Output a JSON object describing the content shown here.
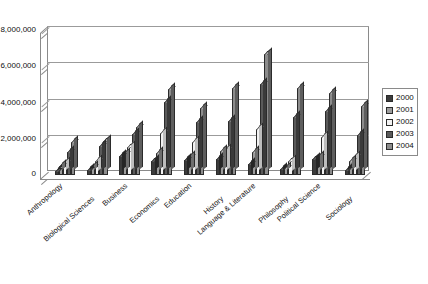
{
  "chart_data": {
    "type": "bar",
    "title": "",
    "subtitle": "",
    "xlabel": "",
    "ylabel": "",
    "ylim": [
      0,
      8000000
    ],
    "yticks": [
      0,
      2000000,
      4000000,
      6000000,
      8000000
    ],
    "ytick_labels": [
      "0",
      "2,000,000",
      "4,000,000",
      "6,000,000",
      "8,000,000"
    ],
    "grid": true,
    "legend_position": "right",
    "style": "3d-clustered-column",
    "categories": [
      "Anthropology",
      "Biological Sciences",
      "Business",
      "Economics",
      "Education",
      "History",
      "Language & Literature",
      "Philosophy",
      "Political Science",
      "Sociology"
    ],
    "series": [
      {
        "name": "2000",
        "color": "#3b3b3b",
        "values": [
          200000,
          250000,
          1050000,
          750000,
          850000,
          900000,
          600000,
          350000,
          900000,
          250000
        ]
      },
      {
        "name": "2001",
        "color": "#9d9d9d",
        "values": [
          500000,
          450000,
          1150000,
          1200000,
          1000000,
          1300000,
          1250000,
          400000,
          1000000,
          750000
        ]
      },
      {
        "name": "2002",
        "color": "#f2f2f2",
        "values": [
          650000,
          800000,
          1550000,
          2300000,
          1800000,
          1400000,
          2550000,
          800000,
          2100000,
          1000000
        ]
      },
      {
        "name": "2003",
        "color": "#5a5a5a",
        "values": [
          1250000,
          1600000,
          2250000,
          4050000,
          2950000,
          3000000,
          5000000,
          3200000,
          3550000,
          2200000
        ]
      },
      {
        "name": "2004",
        "color": "#8c8c8c",
        "values": [
          1800000,
          1850000,
          2650000,
          4750000,
          3700000,
          4800000,
          6650000,
          4800000,
          4550000,
          3800000
        ]
      }
    ]
  },
  "legend": {
    "items": [
      {
        "label": "2000",
        "swatch_class": "s0"
      },
      {
        "label": "2001",
        "swatch_class": "s1"
      },
      {
        "label": "2002",
        "swatch_class": "s2"
      },
      {
        "label": "2003",
        "swatch_class": "s3"
      },
      {
        "label": "2004",
        "swatch_class": "s4"
      }
    ]
  }
}
